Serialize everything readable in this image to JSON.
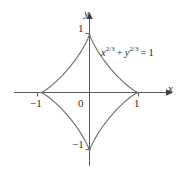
{
  "figure": {
    "kind": "astroid-graph",
    "background_color": "#ffffff",
    "curve_color": "#6e6e6e",
    "axis_color": "#5a5a5a",
    "text_color": "#2b2b2b"
  },
  "annotation": {
    "equation_plain": "x^{2/3} + y^{2/3} = 1",
    "base_x": "x",
    "exp_x": "2/3",
    "plus": "+",
    "base_y": "y",
    "exp_y": "2/3",
    "equals": "=",
    "rhs": "1"
  },
  "axes": {
    "x_axis_label": "x",
    "y_axis_label": "y",
    "origin_label": "0",
    "x_ticks": [
      {
        "value": -1,
        "label": "−1"
      },
      {
        "value": 1,
        "label": "1"
      }
    ],
    "y_ticks": [
      {
        "value": 1,
        "label": "1"
      },
      {
        "value": -1,
        "label": "−1"
      }
    ]
  },
  "chart_data": {
    "type": "line",
    "title": "",
    "subtitle": "",
    "xlabel": "x",
    "ylabel": "y",
    "xlim": [
      -1.35,
      1.35
    ],
    "ylim": [
      -1.35,
      1.35
    ],
    "grid": false,
    "legend": null,
    "annotations": [
      {
        "text": "x^{2/3} + y^{2/3} = 1",
        "x": 0.35,
        "y": 0.78
      }
    ],
    "xticks": [
      -1,
      1
    ],
    "xticklabels": [
      "−1",
      "1"
    ],
    "yticks": [
      -1,
      1
    ],
    "yticklabels": [
      "1",
      "−1"
    ],
    "series": [
      {
        "name": "astroid x^(2/3) + y^(2/3) = 1",
        "parametric": true,
        "parametrization": "x = cos^3(t), y = sin^3(t), t in [0, 2pi)",
        "closed": true,
        "cusps": [
          {
            "x": 1,
            "y": 0
          },
          {
            "x": 0,
            "y": 1
          },
          {
            "x": -1,
            "y": 0
          },
          {
            "x": 0,
            "y": -1
          }
        ],
        "x": [
          1.0,
          0.978,
          0.915,
          0.817,
          0.693,
          0.556,
          0.416,
          0.286,
          0.175,
          0.089,
          0.031,
          0.004,
          0.0,
          -0.004,
          -0.031,
          -0.089,
          -0.175,
          -0.286,
          -0.416,
          -0.556,
          -0.693,
          -0.817,
          -0.915,
          -0.978,
          -1.0,
          -0.978,
          -0.915,
          -0.817,
          -0.693,
          -0.556,
          -0.416,
          -0.286,
          -0.175,
          -0.089,
          -0.031,
          -0.004,
          0.0,
          0.004,
          0.031,
          0.089,
          0.175,
          0.286,
          0.416,
          0.556,
          0.693,
          0.817,
          0.915,
          0.978,
          1.0
        ],
        "y": [
          0.0,
          0.004,
          0.031,
          0.089,
          0.175,
          0.286,
          0.416,
          0.556,
          0.693,
          0.817,
          0.915,
          0.978,
          1.0,
          0.978,
          0.915,
          0.817,
          0.693,
          0.556,
          0.416,
          0.286,
          0.175,
          0.089,
          0.031,
          0.004,
          0.0,
          -0.004,
          -0.031,
          -0.089,
          -0.175,
          -0.286,
          -0.416,
          -0.556,
          -0.693,
          -0.817,
          -0.915,
          -0.978,
          -1.0,
          -0.978,
          -0.915,
          -0.817,
          -0.693,
          -0.556,
          -0.416,
          -0.286,
          -0.175,
          -0.089,
          -0.031,
          -0.004,
          0.0
        ]
      }
    ]
  }
}
